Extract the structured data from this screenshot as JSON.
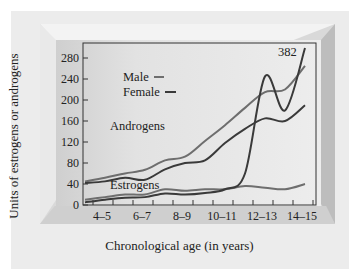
{
  "chart_data": {
    "type": "line",
    "title": "",
    "xlabel": "Chronological age (in years)",
    "ylabel": "Units of estrogens or androgens",
    "categories": [
      "4–5",
      "6–7",
      "8–9",
      "10–11",
      "12–13",
      "14–15"
    ],
    "x": [
      3.5,
      4.5,
      5.5,
      6.5,
      7.5,
      8.5,
      9.5,
      10.5,
      11.5,
      12.5,
      13.5,
      14.5
    ],
    "ylim": [
      0,
      280
    ],
    "yticks": [
      0,
      40,
      80,
      120,
      160,
      200,
      240,
      280
    ],
    "grid": false,
    "legend": {
      "position": "upper-left",
      "entries": [
        {
          "label": "Male",
          "color": "#6e6e6e"
        },
        {
          "label": "Female",
          "color": "#3a3a3a"
        }
      ]
    },
    "annotations": [
      {
        "text": "Androgens",
        "near": "androgen curves"
      },
      {
        "text": "Estrogens",
        "near": "estrogen curves"
      },
      {
        "text": "382",
        "near": "female estrogen at 14–15 (off scale)"
      }
    ],
    "series": [
      {
        "name": "Male androgens",
        "color": "#6e6e6e",
        "x": [
          3.5,
          4.5,
          5.5,
          6.5,
          7.5,
          8.5,
          9.5,
          10.5,
          11.5,
          12.5,
          13.5,
          14.5
        ],
        "values": [
          45,
          52,
          60,
          67,
          85,
          92,
          122,
          152,
          185,
          215,
          220,
          265
        ]
      },
      {
        "name": "Female androgens",
        "color": "#3a3a3a",
        "x": [
          3.5,
          4.5,
          5.5,
          6.5,
          7.5,
          8.5,
          9.5,
          10.5,
          11.5,
          12.5,
          13.5,
          14.5
        ],
        "values": [
          42,
          45,
          52,
          48,
          68,
          80,
          85,
          118,
          145,
          165,
          160,
          190
        ]
      },
      {
        "name": "Male estrogens",
        "color": "#6e6e6e",
        "x": [
          3.5,
          4.5,
          5.5,
          6.5,
          7.5,
          8.5,
          9.5,
          10.5,
          11.5,
          12.5,
          13.5,
          14.5
        ],
        "values": [
          10,
          15,
          20,
          20,
          30,
          27,
          30,
          30,
          36,
          33,
          30,
          40
        ]
      },
      {
        "name": "Female estrogens",
        "color": "#3a3a3a",
        "x": [
          3.5,
          4.5,
          5.5,
          6.5,
          7.5,
          8.5,
          9.5,
          10.5,
          11.5,
          12.5,
          13.5,
          14.5
        ],
        "values": [
          5,
          10,
          14,
          15,
          22,
          20,
          23,
          30,
          60,
          245,
          180,
          382
        ]
      }
    ]
  },
  "labels": {
    "legend_male": "Male",
    "legend_female": "Female",
    "androgens": "Androgens",
    "estrogens": "Estrogens",
    "peak_value": "382",
    "ylabel": "Units of estrogens or androgens",
    "xlabel": "Chronological age (in years)"
  }
}
